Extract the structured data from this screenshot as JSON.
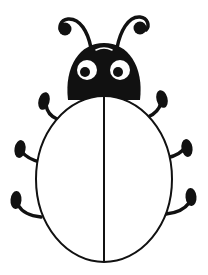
{
  "image": {
    "subject": "bug clipart",
    "style": "black outline illustration on white",
    "width": 208,
    "height": 275
  },
  "colors": {
    "background": "#ffffff",
    "ink": "#111111",
    "eye_white": "#ffffff",
    "body_fill": "#ffffff"
  },
  "parts": {
    "head": {
      "label": "head"
    },
    "eyes": [
      {
        "label": "left eye"
      },
      {
        "label": "right eye"
      }
    ],
    "antennae": [
      {
        "label": "left antenna"
      },
      {
        "label": "right antenna"
      }
    ],
    "body": {
      "label": "body shell"
    },
    "legs": [
      {
        "label": "left front leg"
      },
      {
        "label": "left middle leg"
      },
      {
        "label": "left back leg"
      },
      {
        "label": "right front leg"
      },
      {
        "label": "right middle leg"
      },
      {
        "label": "right back leg"
      }
    ]
  }
}
